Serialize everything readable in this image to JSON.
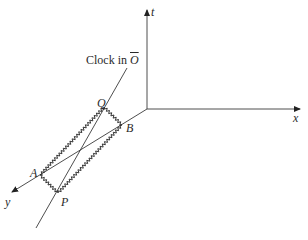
{
  "diagram": {
    "type": "spacetime-diagram",
    "axes": {
      "t": {
        "label": "t",
        "from": [
          147,
          109
        ],
        "to": [
          147,
          8
        ]
      },
      "x": {
        "label": "x",
        "from": [
          147,
          109
        ],
        "to": [
          302,
          109
        ]
      },
      "y": {
        "label": "y",
        "from": [
          147,
          109
        ],
        "to": [
          10,
          193
        ]
      }
    },
    "clock_worldline": {
      "label_prefix": "Clock in ",
      "label_frame": "O",
      "from": [
        127,
        68
      ],
      "to": [
        36,
        228
      ]
    },
    "points": {
      "Q": {
        "label": "Q",
        "pos": [
          104,
          107
        ]
      },
      "B": {
        "label": "B",
        "pos": [
          122,
          125
        ]
      },
      "A": {
        "label": "A",
        "pos": [
          40,
          175
        ]
      },
      "P": {
        "label": "P",
        "pos": [
          58,
          193
        ]
      }
    },
    "colors": {
      "line": "#3a3a3a",
      "text": "#2a2a2a"
    }
  }
}
